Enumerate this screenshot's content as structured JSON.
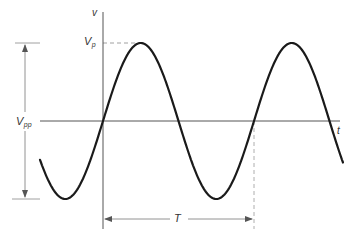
{
  "diagram": {
    "type": "sine-waveform",
    "labels": {
      "v_axis": "v",
      "t_axis": "t",
      "peak_main": "V",
      "peak_sub": "p",
      "pp_main": "V",
      "pp_sub": "pp",
      "period": "T"
    },
    "colors": {
      "curve": "#1a1a1a",
      "axis": "#555555",
      "guide": "#888888",
      "text": "#333333"
    },
    "geometry": {
      "origin_x": 103,
      "baseline_y": 121,
      "amplitude_px": 78,
      "period_px": 151,
      "curve_start_x": 40,
      "curve_end_x": 343
    }
  }
}
